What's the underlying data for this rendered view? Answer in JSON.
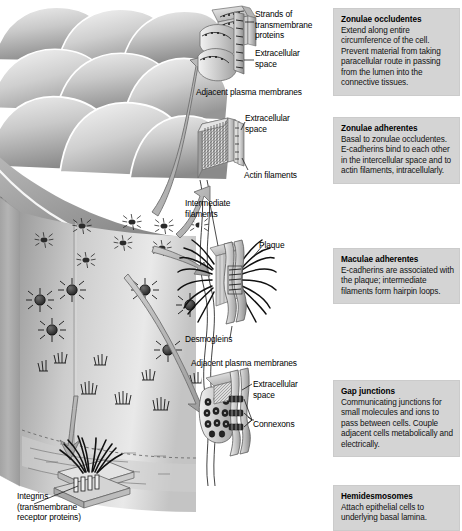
{
  "figure": {
    "kind": "biology-diagram"
  },
  "diagram_labels": [
    {
      "id": "strands-of-transmembrane-proteins",
      "text": "Strands of\ntransmembrane\nproteins",
      "x": 255,
      "y": 13
    },
    {
      "id": "extracellular-space-tight",
      "text": "Extracellular\nspace",
      "x": 255,
      "y": 52
    },
    {
      "id": "adjacent-plasma-membranes-top",
      "text": "Adjacent plasma membranes",
      "x": 196,
      "y": 90
    },
    {
      "id": "extracellular-space-zonula",
      "text": "Extracellular\nspace",
      "x": 245,
      "y": 116
    },
    {
      "id": "actin-filaments",
      "text": "Actin filaments",
      "x": 245,
      "y": 172
    },
    {
      "id": "intermediate-filaments",
      "text": "Intermediate\nfilaments",
      "x": 186,
      "y": 201
    },
    {
      "id": "plaque",
      "text": "Plaque",
      "x": 259,
      "y": 242
    },
    {
      "id": "desmogleins",
      "text": "Desmogleins",
      "x": 186,
      "y": 336
    },
    {
      "id": "adjacent-plasma-membranes-bottom",
      "text": "Adjacent plasma membranes",
      "x": 192,
      "y": 361
    },
    {
      "id": "extracellular-space-gap",
      "text": "Extracellular\nspace",
      "x": 253,
      "y": 382
    },
    {
      "id": "connexons",
      "text": "Connexons",
      "x": 253,
      "y": 422
    },
    {
      "id": "integrins",
      "text": "Integrins\n(transmembrane\nreceptor proteins)",
      "x": 18,
      "y": 494
    }
  ],
  "info_boxes": [
    {
      "id": "zonulae-occludentes",
      "title": "Zonulae occludentes",
      "body": "Extend along entire circumference of the cell. Prevent material from taking paracellular route in passing from the lumen into the connective tissues.",
      "top": 8,
      "height": 92
    },
    {
      "id": "zonulae-adherentes",
      "title": "Zonulae adherentes",
      "body": "Basal to zonulae occludentes.\nE-cadherins bind to each other in the intercellular space and to actin filaments, intracellularly.",
      "top": 117,
      "height": 86
    },
    {
      "id": "maculae-adherentes",
      "title": "Maculae adherentes",
      "body": "E-cadherins are associated with the plaque; intermediate filaments form hairpin loops.",
      "top": 248,
      "height": 52
    },
    {
      "id": "gap-junctions",
      "title": "Gap junctions",
      "body": "Communicating junctions for small molecules and ions to pass between cells. Couple adjacent cells metabolically and electrically.",
      "top": 380,
      "height": 79
    },
    {
      "id": "hemidesmosomes",
      "title": "Hemidesmosomes",
      "body": "Attach epithelial cells to underlying basal lamina.",
      "top": 485,
      "height": 35
    }
  ],
  "colors": {
    "box_background": "#d4d4d4",
    "box_border": "#cbcbcb",
    "text": "#000000",
    "page_background": "#ffffff",
    "ink_dark": "#1a1a1a",
    "ink_mid": "#808080",
    "ink_light": "#d9d9d9"
  }
}
